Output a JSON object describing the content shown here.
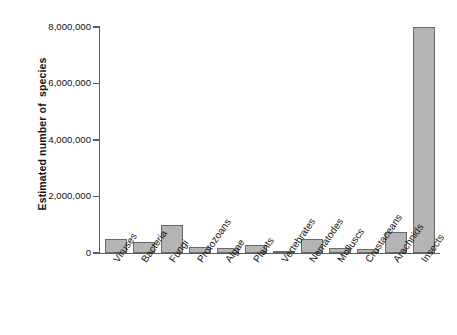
{
  "chart_data": {
    "type": "bar",
    "title": "",
    "xlabel": "",
    "ylabel": "Estimated number of  species",
    "ylim": [
      0,
      8000000
    ],
    "ytick_values": [
      0,
      2000000,
      4000000,
      6000000,
      8000000
    ],
    "ytick_labels": [
      "0",
      "2,000,000",
      "4,000,000",
      "6,000,000",
      "8,000,000"
    ],
    "grid": false,
    "legend": false,
    "bar_fill_color": "#b4b4b4",
    "bar_border_color": "#6a6a6a",
    "axis_color": "#5d5d5d",
    "categories": [
      "Viruses",
      "Bacteria",
      "Fungi",
      "Protozoans",
      "Algae",
      "Plants",
      "Vertebrates",
      "Nematodes",
      "Molluscs",
      "Crustaceans",
      "Arachnids",
      "Insects"
    ],
    "values": [
      500000,
      400000,
      1000000,
      200000,
      160000,
      300000,
      55000,
      500000,
      180000,
      130000,
      750000,
      8000000
    ]
  }
}
